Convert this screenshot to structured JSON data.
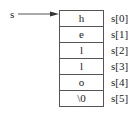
{
  "diagram": {
    "pointer": {
      "label": "s"
    },
    "array": {
      "cells": [
        {
          "value": "h",
          "index_label": "s[0]"
        },
        {
          "value": "e",
          "index_label": "s[1]"
        },
        {
          "value": "l",
          "index_label": "s[2]"
        },
        {
          "value": "l",
          "index_label": "s[3]"
        },
        {
          "value": "o",
          "index_label": "s[4]"
        },
        {
          "value": "\\0",
          "index_label": "s[5]"
        }
      ]
    },
    "colors": {
      "line": "#555555",
      "text": "#222222",
      "background": "#ffffff"
    }
  }
}
